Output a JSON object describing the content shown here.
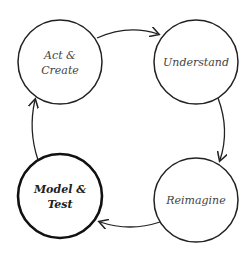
{
  "diagram": {
    "type": "cycle",
    "nodes": [
      {
        "id": "act",
        "line1": "Act &",
        "line2": "Create",
        "emphasis": false
      },
      {
        "id": "understand",
        "line1": "Understand",
        "line2": "",
        "emphasis": false
      },
      {
        "id": "reimagine",
        "line1": "Reimagine",
        "line2": "",
        "emphasis": false
      },
      {
        "id": "model",
        "line1": "Model &",
        "line2": "Test",
        "emphasis": true
      }
    ],
    "edges": [
      {
        "from": "act",
        "to": "understand"
      },
      {
        "from": "understand",
        "to": "reimagine"
      },
      {
        "from": "reimagine",
        "to": "model"
      },
      {
        "from": "model",
        "to": "act"
      }
    ],
    "colors": {
      "stroke": "#222222",
      "text": "#444444",
      "background": "#ffffff"
    }
  }
}
